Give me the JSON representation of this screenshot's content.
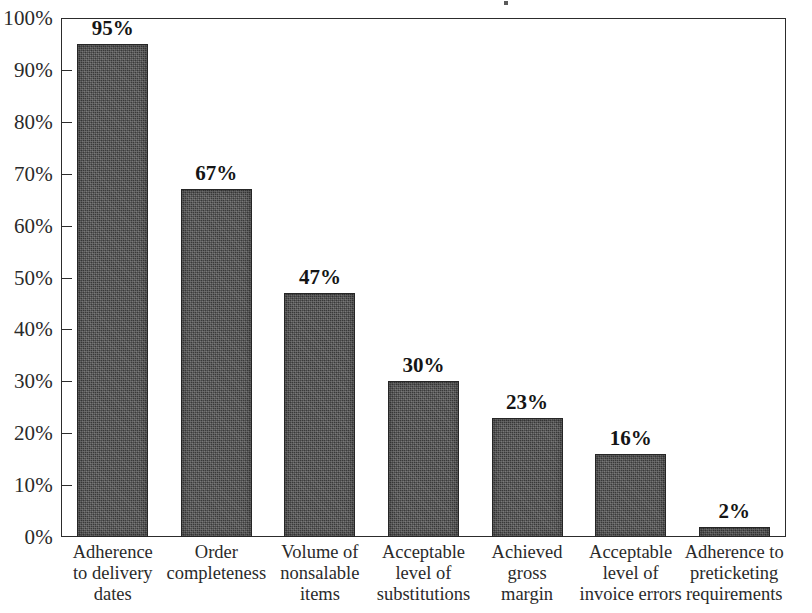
{
  "chart_data": {
    "type": "bar",
    "title": "",
    "xlabel": "",
    "ylabel": "",
    "ylim": [
      0,
      100
    ],
    "grid": false,
    "legend": "none",
    "units": "percent",
    "categories": [
      "Adherence to delivery dates",
      "Order completeness",
      "Volume of nonsalable items",
      "Acceptable level of substitutions",
      "Achieved gross margin",
      "Acceptable level of invoice errors",
      "Adherence to preticketing requirements"
    ],
    "category_lines": [
      [
        "Adherence",
        "to delivery",
        "dates"
      ],
      [
        "Order",
        "completeness"
      ],
      [
        "Volume of",
        "nonsalable",
        "items"
      ],
      [
        "Acceptable",
        "level of",
        "substitutions"
      ],
      [
        "Achieved",
        "gross",
        "margin"
      ],
      [
        "Acceptable",
        "level of",
        "invoice errors"
      ],
      [
        "Adherence to",
        "preticketing",
        "requirements"
      ]
    ],
    "values": [
      95,
      67,
      47,
      30,
      23,
      16,
      2
    ],
    "value_labels": [
      "95%",
      "67%",
      "47%",
      "30%",
      "23%",
      "16%",
      "2%"
    ],
    "yticks": [
      0,
      10,
      20,
      30,
      40,
      50,
      60,
      70,
      80,
      90,
      100
    ],
    "ytick_labels": [
      "0%",
      "10%",
      "20%",
      "30%",
      "40%",
      "50%",
      "60%",
      "70%",
      "80%",
      "90%",
      "100%"
    ],
    "bar_color": "#3c3c3c",
    "axis_color": "#2c2c2c",
    "background_color": "#ffffff"
  }
}
